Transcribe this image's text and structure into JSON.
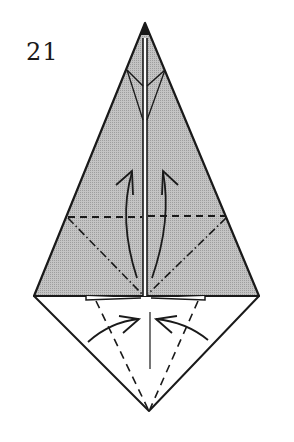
{
  "diagram": {
    "step_number": "21",
    "colors": {
      "paper_colored": "#b8b8b8",
      "paper_white": "#ffffff",
      "line": "#1a1a1a"
    },
    "fold_lines": {
      "valley": "dashed",
      "mountain": "dash-dot"
    },
    "arrows": [
      {
        "name": "left-upward-fold-arrow",
        "direction": "up"
      },
      {
        "name": "right-upward-fold-arrow",
        "direction": "up"
      },
      {
        "name": "left-inward-fold-arrow",
        "direction": "right"
      },
      {
        "name": "right-inward-fold-arrow",
        "direction": "left"
      }
    ]
  }
}
